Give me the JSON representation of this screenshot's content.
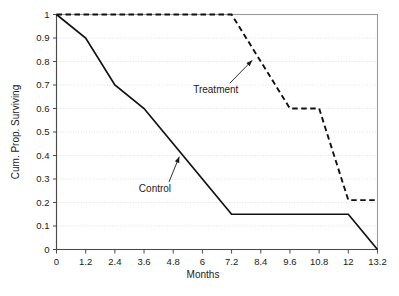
{
  "chart_data": {
    "type": "line",
    "title": "",
    "xlabel": "Months",
    "ylabel": "Cum. Prop. Surviving",
    "xlim": [
      0,
      13.2
    ],
    "ylim": [
      0,
      1
    ],
    "grid": "horizontal-dotted",
    "legend": "inline-annotations",
    "xticks": [
      "0",
      "1.2",
      "2.4",
      "3.6",
      "4.8",
      "6",
      "7.2",
      "8.4",
      "9.6",
      "10.8",
      "12",
      "13.2"
    ],
    "xtick_values": [
      0,
      1.2,
      2.4,
      3.6,
      4.8,
      6,
      7.2,
      8.4,
      9.6,
      10.8,
      12,
      13.2
    ],
    "yticks": [
      "1",
      "0.9",
      "0.8",
      "0.7",
      "0.6",
      "0.5",
      "0.4",
      "0.3",
      "0.2",
      "0.1",
      "0"
    ],
    "ytick_values": [
      1,
      0.9,
      0.8,
      0.7,
      0.6,
      0.5,
      0.4,
      0.3,
      0.2,
      0.1,
      0
    ],
    "series": [
      {
        "name": "Control",
        "style": "solid",
        "color": "#111111",
        "x": [
          0,
          1.2,
          2.4,
          3.6,
          4.8,
          6,
          7.2,
          12,
          13.2
        ],
        "values": [
          1.0,
          0.9,
          0.7,
          0.6,
          0.45,
          0.3,
          0.15,
          0.15,
          0.0
        ]
      },
      {
        "name": "Treatment",
        "style": "dashed",
        "color": "#111111",
        "x": [
          0,
          7.2,
          9.6,
          10.8,
          12,
          13.2
        ],
        "values": [
          1.0,
          1.0,
          0.6,
          0.6,
          0.21,
          0.21
        ]
      }
    ],
    "annotations": [
      {
        "label": "Control",
        "label_x": 4.05,
        "label_y": 0.245,
        "point_x": 5.05,
        "point_y": 0.395
      },
      {
        "label": "Treatment",
        "label_x": 6.55,
        "label_y": 0.665,
        "point_x": 8.05,
        "point_y": 0.805
      }
    ]
  }
}
